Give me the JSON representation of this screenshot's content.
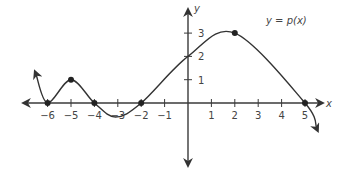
{
  "chart_data": {
    "type": "line",
    "title": "",
    "function_label": "y = p(x)",
    "xlabel": "x",
    "ylabel": "y",
    "x_ticks": [
      -6,
      -5,
      -4,
      -3,
      -2,
      -1,
      1,
      2,
      3,
      4,
      5
    ],
    "y_ticks": [
      1,
      2,
      3
    ],
    "xlim": [
      -6.7,
      5.8
    ],
    "ylim": [
      -3,
      3.6
    ],
    "grid": false,
    "series": [
      {
        "name": "p(x)",
        "points": [
          {
            "x": -6.5,
            "y": 1.25
          },
          {
            "x": -6,
            "y": 0
          },
          {
            "x": -5,
            "y": 1
          },
          {
            "x": -4,
            "y": 0
          },
          {
            "x": -3.1,
            "y": -0.6
          },
          {
            "x": -2,
            "y": 0
          },
          {
            "x": 0,
            "y": 2
          },
          {
            "x": 2,
            "y": 3
          },
          {
            "x": 5,
            "y": 0
          },
          {
            "x": 5.5,
            "y": -1.1
          }
        ],
        "marked_points": [
          {
            "x": -6,
            "y": 0
          },
          {
            "x": -5,
            "y": 1
          },
          {
            "x": -4,
            "y": 0
          },
          {
            "x": -2,
            "y": 0
          },
          {
            "x": 2,
            "y": 3
          },
          {
            "x": 5,
            "y": 0
          }
        ]
      }
    ]
  },
  "labels": {
    "function": "y = p(x)",
    "x_axis": "x",
    "y_axis": "y",
    "x_ticks": [
      "−6",
      "−5",
      "−4",
      "−3",
      "−2",
      "−1",
      "1",
      "2",
      "3",
      "4",
      "5"
    ],
    "y_ticks": [
      "1",
      "2",
      "3"
    ]
  },
  "colors": {
    "axis": "#3a3a3a",
    "curve": "#333333",
    "text": "#444444"
  }
}
